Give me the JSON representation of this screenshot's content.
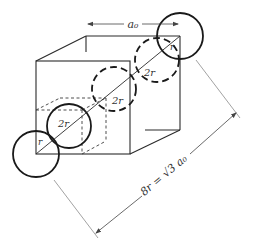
{
  "diagram": {
    "type": "bcc-unit-cell-body-diagonal",
    "labels": {
      "lattice_param": "a₀",
      "radius_corner_top": "r",
      "radius_corner_bottom": "r",
      "diameter_upper": "2r",
      "diameter_middle": "2r",
      "diameter_lower": "2r",
      "body_diagonal": "8r = √3 a₀"
    },
    "colors": {
      "line": "#2a2a2a",
      "dimension_line": "#8a8a8a",
      "background": "#ffffff"
    }
  }
}
